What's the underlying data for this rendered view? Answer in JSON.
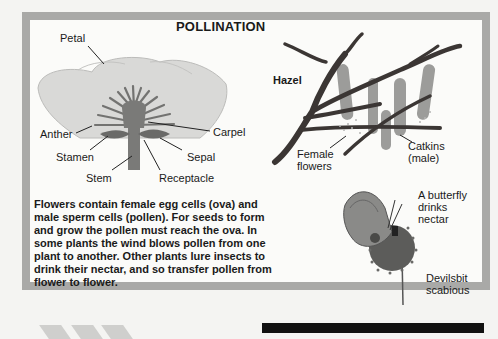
{
  "title": "POLLINATION",
  "flower_labels": {
    "petal": "Petal",
    "anther": "Anther",
    "stamen": "Stamen",
    "stem": "Stem",
    "carpel": "Carpel",
    "sepal": "Sepal",
    "receptacle": "Receptacle"
  },
  "hazel_labels": {
    "hazel": "Hazel",
    "female_flowers_1": "Female",
    "female_flowers_2": "flowers",
    "catkins_1": "Catkins",
    "catkins_2": "(male)"
  },
  "butterfly_labels": {
    "butterfly_1": "A butterfly",
    "butterfly_2": "drinks",
    "butterfly_3": "nectar",
    "scabious_1": "Devilsbit",
    "scabious_2": "scabious"
  },
  "body_text": [
    "Flowers contain female egg cells (ova) and",
    "male sperm cells (pollen). For seeds to form",
    "and grow the pollen must reach the ova. In",
    "some plants the wind blows pollen from one",
    "plant to another. Other plants lure insects to",
    "drink their nectar, and so transfer pollen from",
    "flower to flower."
  ],
  "colors": {
    "frame": "#a9a9a7",
    "petal": "#d8d8d6",
    "stamen": "#6e6e6c",
    "branch": "#3a3533",
    "catkin": "#9a9a98"
  }
}
